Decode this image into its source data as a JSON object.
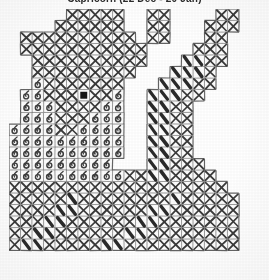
{
  "document": {
    "title": "Capricorn (22 Dec - 20 Jan)",
    "type": "cross-stitch-pattern-chart",
    "appearance": "photocopied grayscale scan, title clipped by top edge"
  },
  "chart_data": {
    "type": "heatmap",
    "title": "Capricorn (22 Dec - 20 Jan)",
    "xlabel": "",
    "ylabel": "",
    "grid": true,
    "columns": 21,
    "rows": 22,
    "cell_px": 11.5,
    "xlim": [
      0,
      21
    ],
    "ylim": [
      0,
      22
    ],
    "legend_position": "none",
    "symbols": [
      {
        "key": "x",
        "name": "cross-stitch-x",
        "glyph": "X",
        "color": "#3a3a3a"
      },
      {
        "key": "loop",
        "name": "cross-stitch-loop",
        "glyph": "6",
        "color": "#3f3f3f"
      },
      {
        "key": "slash",
        "name": "cross-stitch-backslash",
        "glyph": "\\",
        "color": "#2a2a2a"
      },
      {
        "key": "fill",
        "name": "center-marker",
        "glyph": "■",
        "color": "#141414"
      },
      {
        "key": "",
        "name": "empty-cell",
        "glyph": "",
        "color": "#ffffff"
      }
    ],
    "center_marker": {
      "col": 6,
      "row": 7
    },
    "cells": [
      [
        "",
        "",
        "",
        "",
        "",
        "x",
        "x",
        "x",
        "x",
        "x",
        "",
        "",
        "x",
        "x",
        "",
        "",
        "",
        "",
        "x",
        "x",
        ""
      ],
      [
        "",
        "",
        "",
        "",
        "x",
        "x",
        "x",
        "x",
        "x",
        "x",
        "",
        "",
        "x",
        "x",
        "",
        "",
        "",
        "x",
        "x",
        "x",
        ""
      ],
      [
        "",
        "x",
        "x",
        "x",
        "x",
        "x",
        "x",
        "x",
        "x",
        "x",
        "x",
        "",
        "x",
        "x",
        "",
        "",
        "",
        "x",
        "x",
        "",
        ""
      ],
      [
        "",
        "x",
        "x",
        "x",
        "x",
        "x",
        "x",
        "x",
        "x",
        "x",
        "x",
        "x",
        "",
        "",
        "",
        "",
        "x",
        "x",
        "x",
        "",
        ""
      ],
      [
        "",
        "",
        "x",
        "x",
        "x",
        "x",
        "x",
        "x",
        "x",
        "x",
        "x",
        "x",
        "",
        "",
        "",
        "slash",
        "slash",
        "x",
        "x",
        "",
        ""
      ],
      [
        "",
        "",
        "x",
        "x",
        "x",
        "x",
        "x",
        "x",
        "x",
        "x",
        "x",
        "",
        "",
        "",
        "slash",
        "slash",
        "slash",
        "x",
        "",
        "",
        ""
      ],
      [
        "",
        "",
        "loop",
        "x",
        "x",
        "x",
        "x",
        "x",
        "x",
        "x",
        "",
        "",
        "",
        "slash",
        "slash",
        "slash",
        "x",
        "x",
        "",
        "",
        ""
      ],
      [
        "",
        "loop",
        "loop",
        "x",
        "x",
        "x",
        "fill",
        "x",
        "x",
        "loop",
        "",
        "",
        "slash",
        "slash",
        "slash",
        "x",
        "x",
        "",
        "",
        "",
        ""
      ],
      [
        "",
        "loop",
        "loop",
        "loop",
        "x",
        "x",
        "x",
        "x",
        "loop",
        "loop",
        "",
        "",
        "slash",
        "slash",
        "x",
        "x",
        "",
        "",
        "",
        "",
        ""
      ],
      [
        "",
        "loop",
        "loop",
        "loop",
        "x",
        "x",
        "x",
        "loop",
        "loop",
        "loop",
        "",
        "",
        "slash",
        "slash",
        "x",
        "x",
        "",
        "",
        "",
        "",
        ""
      ],
      [
        "loop",
        "loop",
        "loop",
        "loop",
        "x",
        "x",
        "loop",
        "loop",
        "loop",
        "loop",
        "",
        "",
        "slash",
        "slash",
        "x",
        "x",
        "",
        "",
        "",
        "",
        ""
      ],
      [
        "loop",
        "loop",
        "loop",
        "loop",
        "loop",
        "loop",
        "loop",
        "loop",
        "loop",
        "loop",
        "",
        "",
        "slash",
        "slash",
        "x",
        "x",
        "",
        "",
        "",
        "",
        ""
      ],
      [
        "loop",
        "loop",
        "loop",
        "loop",
        "loop",
        "loop",
        "loop",
        "loop",
        "loop",
        "loop",
        "",
        "",
        "slash",
        "slash",
        "x",
        "x",
        "",
        "",
        "",
        "",
        ""
      ],
      [
        "loop",
        "loop",
        "loop",
        "loop",
        "loop",
        "loop",
        "loop",
        "loop",
        "loop",
        "",
        "",
        "",
        "slash",
        "slash",
        "x",
        "x",
        "x",
        "",
        "",
        "",
        ""
      ],
      [
        "loop",
        "loop",
        "loop",
        "loop",
        "loop",
        "loop",
        "loop",
        "loop",
        "loop",
        "loop",
        "x",
        "x",
        "slash",
        "slash",
        "x",
        "x",
        "x",
        "x",
        "",
        "",
        ""
      ],
      [
        "x",
        "x",
        "x",
        "x",
        "x",
        "x",
        "x",
        "x",
        "x",
        "x",
        "x",
        "x",
        "x",
        "x",
        "x",
        "x",
        "x",
        "x",
        "x",
        "",
        ""
      ],
      [
        "x",
        "x",
        "x",
        "x",
        "x",
        "slash",
        "x",
        "x",
        "x",
        "x",
        "x",
        "x",
        "x",
        "x",
        "slash",
        "x",
        "x",
        "x",
        "x",
        "x",
        ""
      ],
      [
        "x",
        "x",
        "x",
        "x",
        "slash",
        "slash",
        "x",
        "x",
        "x",
        "x",
        "x",
        "x",
        "slash",
        "slash",
        "x",
        "x",
        "x",
        "x",
        "x",
        "x",
        ""
      ],
      [
        "x",
        "x",
        "x",
        "slash",
        "slash",
        "x",
        "x",
        "x",
        "x",
        "x",
        "x",
        "slash",
        "slash",
        "x",
        "x",
        "x",
        "x",
        "x",
        "x",
        "x",
        ""
      ],
      [
        "x",
        "x",
        "slash",
        "slash",
        "x",
        "x",
        "x",
        "x",
        "x",
        "x",
        "slash",
        "slash",
        "x",
        "x",
        "x",
        "x",
        "x",
        "x",
        "x",
        "x",
        ""
      ],
      [
        "x",
        "slash",
        "slash",
        "x",
        "x",
        "x",
        "x",
        "x",
        "slash",
        "slash",
        "x",
        "x",
        "x",
        "x",
        "x",
        "x",
        "x",
        "x",
        "x",
        "x",
        ""
      ],
      [
        "",
        "",
        "",
        "",
        "",
        "",
        "",
        "",
        "",
        "",
        "",
        "",
        "",
        "",
        "",
        "",
        "",
        "",
        "",
        "",
        ""
      ]
    ],
    "outline_note": "irregular stepped outline; empty cells outside the motif are not bordered"
  }
}
